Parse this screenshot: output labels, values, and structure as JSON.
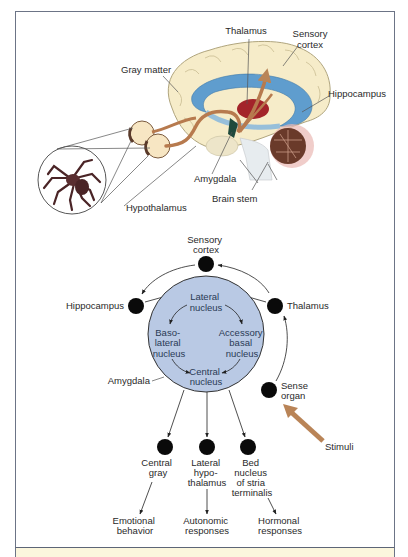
{
  "brain_illustration": {
    "labels": {
      "thalamus": "Thalamus",
      "sensory_cortex_line1": "Sensory",
      "sensory_cortex_line2": "cortex",
      "gray_matter": "Gray matter",
      "hippocampus": "Hippocampus",
      "amygdala": "Amygdala",
      "brain_stem": "Brain stem",
      "hypothalamus": "Hypothalamus"
    },
    "colors": {
      "cortex": "#f6ecc9",
      "ventricle": "#4f95cf",
      "pathway": "#b77a4e",
      "thalamus": "#a3242a",
      "cerebellum": "#6a3a2a"
    }
  },
  "circuit_diagram": {
    "nodes": {
      "sensory_cortex": [
        "Sensory",
        "cortex"
      ],
      "hippocampus": [
        "Hippocampus"
      ],
      "thalamus": [
        "Thalamus"
      ],
      "sense_organ": [
        "Sense",
        "organ"
      ],
      "central_gray": [
        "Central",
        "gray"
      ],
      "lateral_hypothalamus": [
        "Lateral",
        "hypo-",
        "thalamus"
      ],
      "bed_nucleus": [
        "Bed",
        "nucleus",
        "of stria",
        "terminalis"
      ]
    },
    "amygdala": {
      "label": "Amygdala",
      "nuclei": {
        "lateral": [
          "Lateral",
          "nucleus"
        ],
        "basolateral": [
          "Baso-",
          "lateral",
          "nucleus"
        ],
        "accessory_basal": [
          "Accessory",
          "basal",
          "nucleus"
        ],
        "central": [
          "Central",
          "nucleus"
        ]
      }
    },
    "outputs": {
      "emotional": [
        "Emotional",
        "behavior"
      ],
      "autonomic": [
        "Autonomic",
        "responses"
      ],
      "hormonal": [
        "Hormonal",
        "responses"
      ]
    },
    "stimuli": "Stimuli",
    "colors": {
      "amygdala_fill": "#b9c9e4",
      "node": "#0a0a0a",
      "stimuli_arrow": "#b98457"
    }
  }
}
